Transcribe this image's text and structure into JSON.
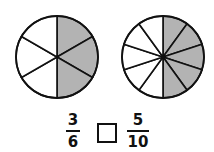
{
  "pies": [
    {
      "id": "left",
      "cx": 57,
      "cy": 57,
      "r": 41,
      "slices": 6,
      "shaded": 3,
      "shade_color": "#b3b3b3"
    },
    {
      "id": "right",
      "cx": 163,
      "cy": 57,
      "r": 41,
      "slices": 10,
      "shaded": 5,
      "shade_color": "#b3b3b3"
    }
  ],
  "comparison": {
    "left": {
      "numerator": "3",
      "denominator": "6"
    },
    "operator_box": "",
    "right": {
      "numerator": "5",
      "denominator": "10"
    }
  }
}
